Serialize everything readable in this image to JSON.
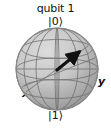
{
  "figure": {
    "type": "bloch-sphere",
    "title": "qubit 1",
    "background_color": "#ffffff",
    "labels": {
      "north_pole": "|0⟩",
      "south_pole": "|1⟩",
      "x_axis": "x",
      "y_axis": "y"
    },
    "sphere": {
      "center_x": 57,
      "center_y": 69,
      "radius": 41,
      "fill_top_color": "#d3d3d3",
      "fill_bottom_color": "#9a9a9a",
      "outline_color": "#8a8a8a",
      "grid_color": "#6e6e6e",
      "grid_meridians": 4,
      "grid_parallels": 3
    },
    "state_vector": {
      "color": "#111111",
      "tail_x": 57,
      "tail_y": 69,
      "tip_x": 81,
      "tip_y": 50,
      "arrow_head": "solid-triangle"
    },
    "axes": [
      {
        "name": "z",
        "from_label": "|1⟩",
        "to_label": "|0⟩"
      },
      {
        "name": "x",
        "to_label": "x"
      },
      {
        "name": "y",
        "to_label": "y"
      }
    ]
  }
}
